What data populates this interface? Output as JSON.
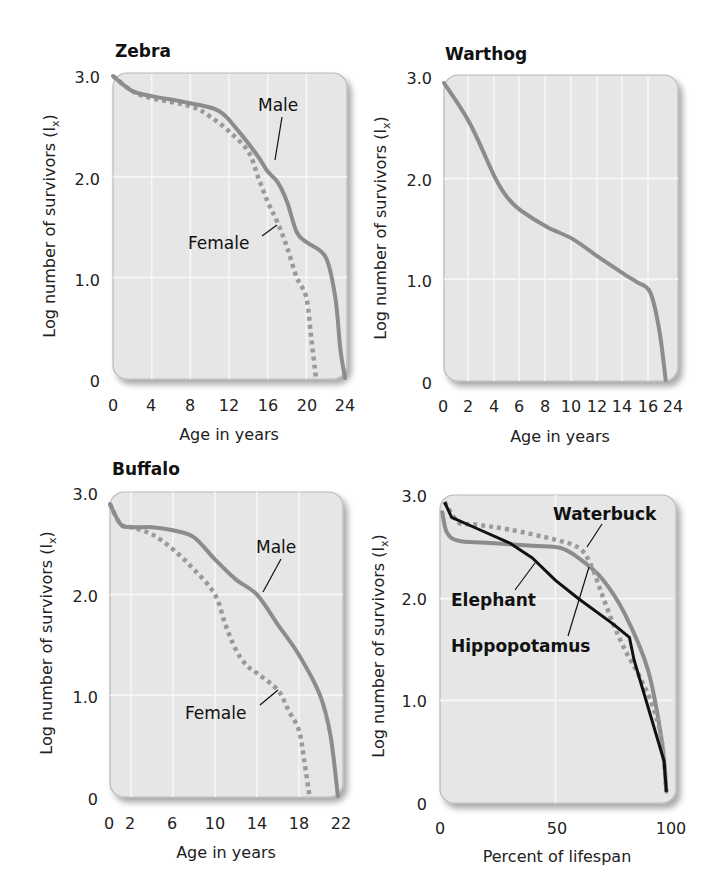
{
  "colors": {
    "plot_bg": "#e6e6e6",
    "grid": "#f7f7f7",
    "frame": "#b8b8b8",
    "male_line": "#8c8c8c",
    "female_line": "#9a9a9a",
    "elephant_line": "#111111"
  },
  "chart_data": [
    {
      "type": "line",
      "title": "Zebra",
      "xlabel": "Age in years",
      "ylabel": "Log number of survivors (lx)",
      "xticks": [
        "0",
        "4",
        "8",
        "12",
        "16",
        "20",
        "24"
      ],
      "yticks": [
        "0",
        "1.0",
        "2.0",
        "3.0"
      ],
      "xlim": [
        0,
        24
      ],
      "ylim": [
        0,
        3.0
      ],
      "grid": true,
      "series": [
        {
          "name": "Male",
          "style": "solid",
          "x": [
            0,
            2,
            4,
            8,
            11,
            13,
            15,
            16,
            17,
            18,
            19,
            20,
            22,
            23,
            23.5,
            24
          ],
          "y": [
            3.0,
            2.85,
            2.8,
            2.73,
            2.65,
            2.45,
            2.2,
            2.05,
            1.95,
            1.75,
            1.45,
            1.35,
            1.2,
            0.8,
            0.3,
            0
          ]
        },
        {
          "name": "Female",
          "style": "dotted",
          "x": [
            0,
            2,
            4,
            8,
            10,
            12,
            14,
            15,
            16,
            17,
            18,
            19,
            20,
            20.5,
            21
          ],
          "y": [
            3.0,
            2.85,
            2.78,
            2.7,
            2.6,
            2.45,
            2.25,
            2.0,
            1.75,
            1.55,
            1.3,
            1.0,
            0.8,
            0.4,
            0
          ]
        }
      ],
      "annotations": [
        "Male",
        "Female"
      ]
    },
    {
      "type": "line",
      "title": "Warthog",
      "xlabel": "Age in years",
      "ylabel": "Log number of survivors (lx)",
      "xticks": [
        "0",
        "2",
        "4",
        "6",
        "8",
        "10",
        "12",
        "14",
        "16",
        "24"
      ],
      "yticks": [
        "0",
        "1.0",
        "2.0",
        "3.0"
      ],
      "xlim": [
        0,
        18
      ],
      "ylim": [
        0,
        3.0
      ],
      "grid": true,
      "series": [
        {
          "name": "Warthog",
          "style": "solid",
          "x": [
            0,
            2,
            4,
            5,
            6,
            8,
            10,
            12,
            14,
            15,
            16,
            16.7,
            17.2
          ],
          "y": [
            2.95,
            2.55,
            2.0,
            1.8,
            1.68,
            1.52,
            1.4,
            1.22,
            1.05,
            0.97,
            0.87,
            0.5,
            0
          ]
        }
      ]
    },
    {
      "type": "line",
      "title": "Buffalo",
      "xlabel": "Age in years",
      "ylabel": "Log number of survivors (lx)",
      "xticks": [
        "0",
        "2",
        "6",
        "10",
        "14",
        "18",
        "22"
      ],
      "yticks": [
        "0",
        "1.0",
        "2.0",
        "3.0"
      ],
      "xlim": [
        0,
        22
      ],
      "ylim": [
        0,
        3.0
      ],
      "grid": true,
      "series": [
        {
          "name": "Male",
          "style": "solid",
          "x": [
            0,
            1,
            2,
            4,
            6,
            8,
            10,
            12,
            14,
            16,
            18,
            20,
            21,
            21.7
          ],
          "y": [
            2.9,
            2.7,
            2.67,
            2.67,
            2.64,
            2.57,
            2.35,
            2.15,
            2.0,
            1.7,
            1.4,
            1.0,
            0.6,
            0
          ]
        },
        {
          "name": "Female",
          "style": "dotted",
          "x": [
            0,
            1,
            2,
            4,
            6,
            8,
            10,
            11,
            12,
            13,
            14,
            16,
            17,
            18,
            18.5,
            19
          ],
          "y": [
            2.9,
            2.7,
            2.67,
            2.6,
            2.45,
            2.25,
            2.0,
            1.7,
            1.45,
            1.3,
            1.22,
            1.05,
            0.85,
            0.65,
            0.35,
            0
          ]
        }
      ],
      "annotations": [
        "Male",
        "Female"
      ]
    },
    {
      "type": "line",
      "title": "",
      "xlabel": "Percent of lifespan",
      "ylabel": "Log number of survivors (lx)",
      "xticks": [
        "0",
        "50",
        "100"
      ],
      "yticks": [
        "0",
        "1.0",
        "2.0",
        "3.0"
      ],
      "xlim": [
        0,
        100
      ],
      "ylim": [
        0,
        3.0
      ],
      "grid": true,
      "series": [
        {
          "name": "Elephant",
          "style": "solid-black",
          "x": [
            2,
            5,
            15,
            30,
            40,
            50,
            60,
            75,
            82,
            84,
            97,
            98
          ],
          "y": [
            2.95,
            2.8,
            2.7,
            2.55,
            2.4,
            2.18,
            2.0,
            1.75,
            1.62,
            1.4,
            0.4,
            0.1
          ]
        },
        {
          "name": "Hippopotamus",
          "style": "solid-gray",
          "x": [
            1,
            3,
            8,
            20,
            40,
            52,
            60,
            70,
            80,
            90,
            96,
            98
          ],
          "y": [
            2.85,
            2.65,
            2.57,
            2.55,
            2.52,
            2.5,
            2.4,
            2.2,
            1.85,
            1.3,
            0.6,
            0.1
          ]
        },
        {
          "name": "Waterbuck",
          "style": "dotted",
          "x": [
            2,
            8,
            15,
            30,
            50,
            60,
            65,
            70,
            75,
            80,
            86,
            92,
            96,
            98
          ],
          "y": [
            2.95,
            2.75,
            2.73,
            2.68,
            2.58,
            2.5,
            2.35,
            2.05,
            1.75,
            1.5,
            1.25,
            0.95,
            0.6,
            0.1
          ]
        }
      ],
      "annotations": [
        "Waterbuck",
        "Elephant",
        "Hippopotamus"
      ]
    }
  ],
  "panels": [
    {
      "title": "Zebra",
      "xlabel": "Age in years",
      "ylabel": "Log number of survivors (l",
      "ylabel_sub": "x",
      "ylabel_close": ")",
      "ann1": "Male",
      "ann2": "Female"
    },
    {
      "title": "Warthog",
      "xlabel": "Age in years",
      "ylabel": "Log number of survivors (l",
      "ylabel_sub": "x",
      "ylabel_close": ")"
    },
    {
      "title": "Buffalo",
      "xlabel": "Age in years",
      "ylabel": "Log number of survivors (l",
      "ylabel_sub": "x",
      "ylabel_close": ")",
      "ann1": "Male",
      "ann2": "Female"
    },
    {
      "title": "",
      "xlabel": "Percent of lifespan",
      "ylabel": "Log number of survivors (l",
      "ylabel_sub": "x",
      "ylabel_close": ")",
      "ann1": "Waterbuck",
      "ann2": "Elephant",
      "ann3": "Hippopotamus"
    }
  ]
}
